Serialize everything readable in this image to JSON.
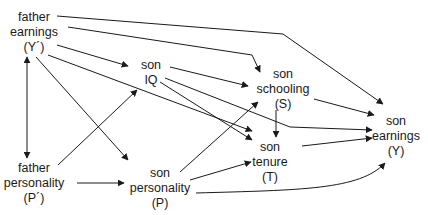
{
  "diagram": {
    "type": "causal-path-diagram",
    "nodes": [
      {
        "id": "father_earnings",
        "lines": [
          "father",
          "earnings",
          "(Y´)"
        ]
      },
      {
        "id": "father_personality",
        "lines": [
          "father",
          "personality",
          "(P´)"
        ]
      },
      {
        "id": "son_iq",
        "lines": [
          "son",
          "IQ"
        ]
      },
      {
        "id": "son_personality",
        "lines": [
          "son",
          "personality",
          "(P)"
        ]
      },
      {
        "id": "son_schooling",
        "lines": [
          "son",
          "schooling",
          "(S)"
        ]
      },
      {
        "id": "son_tenure",
        "lines": [
          "son",
          "tenure",
          "(T)"
        ]
      },
      {
        "id": "son_earnings",
        "lines": [
          "son",
          "earnings",
          "(Y)"
        ]
      }
    ],
    "edges": [
      {
        "from": "father_earnings",
        "to": "son_earnings"
      },
      {
        "from": "father_earnings",
        "to": "son_schooling"
      },
      {
        "from": "father_earnings",
        "to": "son_iq"
      },
      {
        "from": "father_earnings",
        "to": "son_tenure"
      },
      {
        "from": "father_earnings",
        "to": "son_personality"
      },
      {
        "from": "father_earnings",
        "to": "father_personality",
        "bidirectional": true
      },
      {
        "from": "father_personality",
        "to": "son_iq"
      },
      {
        "from": "father_personality",
        "to": "son_personality"
      },
      {
        "from": "son_iq",
        "to": "son_schooling"
      },
      {
        "from": "son_iq",
        "to": "son_tenure"
      },
      {
        "from": "son_iq",
        "to": "son_earnings"
      },
      {
        "from": "son_personality",
        "to": "son_schooling"
      },
      {
        "from": "son_personality",
        "to": "son_tenure"
      },
      {
        "from": "son_personality",
        "to": "son_earnings"
      },
      {
        "from": "son_schooling",
        "to": "son_tenure"
      },
      {
        "from": "son_schooling",
        "to": "son_earnings"
      },
      {
        "from": "son_tenure",
        "to": "son_earnings"
      }
    ]
  }
}
